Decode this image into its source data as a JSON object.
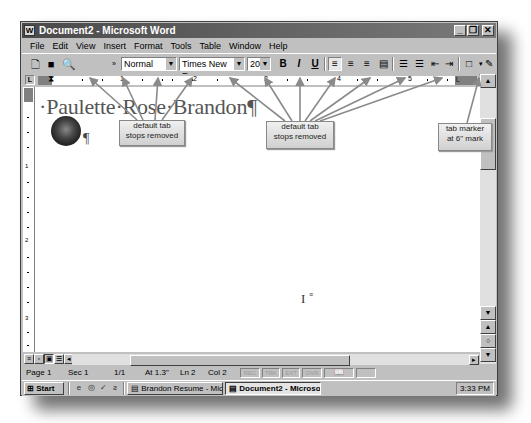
{
  "window": {
    "title": "Document2 - Microsoft Word",
    "controls": {
      "minimize": "_",
      "restore": "❐",
      "close": "✕"
    }
  },
  "menubar": {
    "items": [
      "File",
      "Edit",
      "View",
      "Insert",
      "Format",
      "Tools",
      "Table",
      "Window",
      "Help"
    ]
  },
  "toolbar": {
    "style_value": "Normal",
    "font_value": "Times New Roman",
    "size_value": "20",
    "bold": "B",
    "italic": "I",
    "underline": "U"
  },
  "ruler": {
    "numbers": [
      "1",
      "2",
      "3",
      "4",
      "5"
    ],
    "tab_marker": "└"
  },
  "vertical_ruler": {
    "numbers": [
      "1",
      "2",
      "3"
    ]
  },
  "document": {
    "name_text": "·Paulette·Rose·Brandon¶",
    "logo_pilcrow": "¶",
    "cursor_glyph": "I"
  },
  "callouts": [
    {
      "line1": "default tab",
      "line2": "stops removed"
    },
    {
      "line1": "default tab",
      "line2": "stops removed"
    },
    {
      "line1": "tab marker",
      "line2": "at 6\" mark"
    }
  ],
  "statusbar": {
    "page": "Page 1",
    "section": "Sec 1",
    "page_of": "1/1",
    "at": "At 1.3\"",
    "line": "Ln 2",
    "col": "Col 2",
    "indicators": [
      "REC",
      "TRK",
      "EXT",
      "OVR"
    ]
  },
  "taskbar": {
    "start_label": "Start",
    "tasks": [
      {
        "label": "Brandon Resume - Micros...",
        "active": false
      },
      {
        "label": "Document2 - Microso...",
        "active": true
      }
    ],
    "clock": "3:33 PM"
  }
}
